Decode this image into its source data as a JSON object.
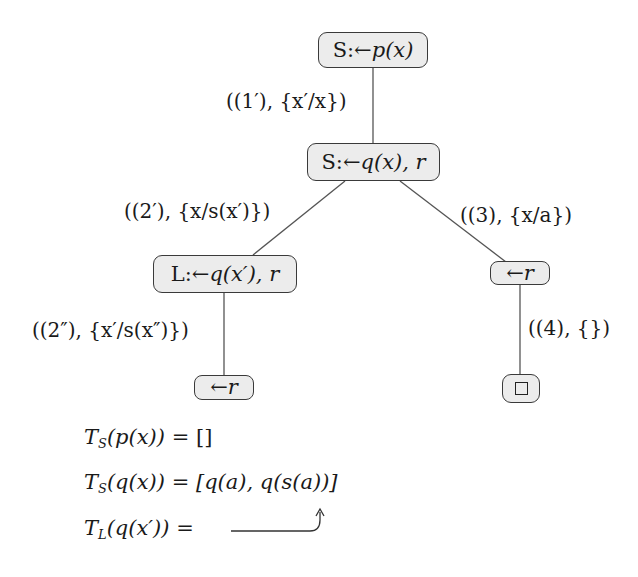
{
  "diagram": {
    "type": "SLD derivation tree with tabling",
    "nodes": [
      {
        "id": "n1",
        "prefix": "S:← ",
        "goal": "p(x)",
        "text": "S:← p(x)"
      },
      {
        "id": "n2",
        "prefix": "S:← ",
        "goal": "q(x), r",
        "text": "S:← q(x), r"
      },
      {
        "id": "n3",
        "prefix": "L:← ",
        "goal": "q(x′), r",
        "text": "L:← q(x′), r"
      },
      {
        "id": "n4",
        "prefix": "← ",
        "goal": "r",
        "text": "← r"
      },
      {
        "id": "n5",
        "prefix": "← ",
        "goal": "r",
        "text": "← r"
      },
      {
        "id": "n6",
        "prefix": "",
        "goal": "□",
        "text": "□",
        "icon": "empty-clause-box"
      }
    ],
    "edges": [
      {
        "from": "n1",
        "to": "n2",
        "label": "((1′), {x′/x})"
      },
      {
        "from": "n2",
        "to": "n3",
        "label": "((2′), {x/s(x′)})"
      },
      {
        "from": "n2",
        "to": "n4",
        "label": "((3), {x/a})"
      },
      {
        "from": "n3",
        "to": "n5",
        "label": "((2″), {x′/s(x″)})"
      },
      {
        "from": "n4",
        "to": "n6",
        "label": "((4), {})"
      }
    ],
    "tables": [
      {
        "lhs": "T",
        "sub": "S",
        "arg": "(p(x))",
        "rhs": "[]"
      },
      {
        "lhs": "T",
        "sub": "S",
        "arg": "(q(x))",
        "rhs": "[q(a), q(s(a))]"
      },
      {
        "lhs": "T",
        "sub": "L",
        "arg": "(q(x′))",
        "rhs": ""
      }
    ],
    "annotations": [
      {
        "type": "curved-arrow",
        "from": "T_L(q(x')) rhs",
        "to": "q(s(a)) in T_S(q(x))"
      }
    ],
    "colors": {
      "node_fill": "#ececec",
      "node_border": "#3a3a3a",
      "edge": "#555555",
      "text": "#1a1a1a"
    }
  }
}
